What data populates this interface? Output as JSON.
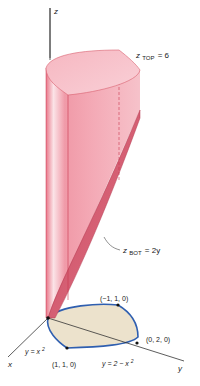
{
  "figure": {
    "type": "3d-solid-diagram",
    "axes": {
      "z_label": "z",
      "x_label": "x",
      "y_label": "y"
    },
    "surfaces": {
      "top": {
        "var": "z",
        "sub": "TOP",
        "rhs": "= 6"
      },
      "bottom": {
        "var": "z",
        "sub": "BOT",
        "rhs": "= 2y"
      }
    },
    "curves": {
      "lower": {
        "text_pre": "y = x",
        "exp": "2"
      },
      "upper": {
        "text_pre": "y = 2 − x",
        "exp": "2"
      }
    },
    "points": [
      {
        "label": "(−1, 1, 0)"
      },
      {
        "label": "(0, 2, 0)"
      },
      {
        "label": "(1, 1, 0)"
      }
    ],
    "colors": {
      "solid_fill": "#f0a0ac",
      "solid_dark": "#d45a6e",
      "solid_edge": "#c9364f",
      "region_fill": "#ece2cc",
      "region_edge": "#2f5fb0",
      "axis": "#333333"
    }
  }
}
